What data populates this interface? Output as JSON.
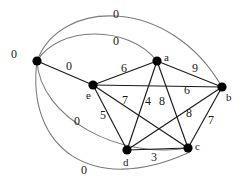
{
  "figure": {
    "kind": "weighted-undirected-graph",
    "width": 241,
    "height": 194,
    "background_color": "#ffffff",
    "edge_color": "#1a1a1a",
    "curved_edge_color": "#7a7a7a",
    "node_color": "#000000"
  },
  "nodes": [
    {
      "id": "s",
      "label": "",
      "x": 37,
      "y": 61,
      "radius": 4.6
    },
    {
      "id": "a",
      "label": "a",
      "x": 157,
      "y": 61,
      "radius": 4.6,
      "label_x": 164,
      "label_y": 52
    },
    {
      "id": "b",
      "label": "b",
      "x": 222,
      "y": 87,
      "radius": 4.6,
      "label_x": 226,
      "label_y": 92
    },
    {
      "id": "c",
      "label": "c",
      "x": 188,
      "y": 148,
      "radius": 4.6,
      "label_x": 195,
      "label_y": 141
    },
    {
      "id": "d",
      "label": "d",
      "x": 127,
      "y": 150,
      "radius": 4.6,
      "label_x": 123,
      "label_y": 157
    },
    {
      "id": "e",
      "label": "e",
      "x": 93,
      "y": 85,
      "radius": 4.6,
      "label_x": 86,
      "label_y": 90
    }
  ],
  "edges": [
    {
      "from": "s",
      "to": "a",
      "weight": "0",
      "style": "curved",
      "label_x": 113,
      "label_y": 35,
      "bend": -34
    },
    {
      "from": "s",
      "to": "b",
      "weight": "0",
      "style": "curved",
      "label_x": 113,
      "label_y": 8,
      "bend": -62
    },
    {
      "from": "s",
      "to": "e",
      "weight": "0",
      "style": "straight",
      "label_x": 66,
      "label_y": 60
    },
    {
      "from": "s",
      "to": "c",
      "weight": "0",
      "style": "curved",
      "label_x": 74,
      "label_y": 115,
      "bend": 42
    },
    {
      "from": "s",
      "to": "d",
      "weight": "0",
      "style": "curved",
      "label_x": 81,
      "label_y": 164,
      "bend": 74
    },
    {
      "from": "s",
      "to": "origin-left",
      "weight": "0",
      "style": "none",
      "label_x": 11,
      "label_y": 48
    },
    {
      "from": "e",
      "to": "a",
      "weight": "6",
      "style": "straight",
      "label_x": 121,
      "label_y": 62
    },
    {
      "from": "a",
      "to": "b",
      "weight": "9",
      "style": "straight",
      "label_x": 192,
      "label_y": 62
    },
    {
      "from": "e",
      "to": "b",
      "weight": "6",
      "style": "straight",
      "label_x": 184,
      "label_y": 84
    },
    {
      "from": "e",
      "to": "c",
      "weight": "7",
      "style": "straight",
      "label_x": 122,
      "label_y": 94
    },
    {
      "from": "e",
      "to": "d",
      "weight": "5",
      "style": "straight",
      "label_x": 100,
      "label_y": 109
    },
    {
      "from": "a",
      "to": "d",
      "weight": "4",
      "style": "straight",
      "label_x": 145,
      "label_y": 95
    },
    {
      "from": "a",
      "to": "c",
      "weight": "8",
      "style": "straight",
      "label_x": 159,
      "label_y": 95
    },
    {
      "from": "d",
      "to": "b",
      "weight": "8",
      "style": "straight",
      "label_x": 186,
      "label_y": 107
    },
    {
      "from": "c",
      "to": "b",
      "weight": "7",
      "style": "straight",
      "label_x": 208,
      "label_y": 114
    },
    {
      "from": "d",
      "to": "c",
      "weight": "3",
      "style": "straight",
      "label_x": 151,
      "label_y": 151
    }
  ]
}
